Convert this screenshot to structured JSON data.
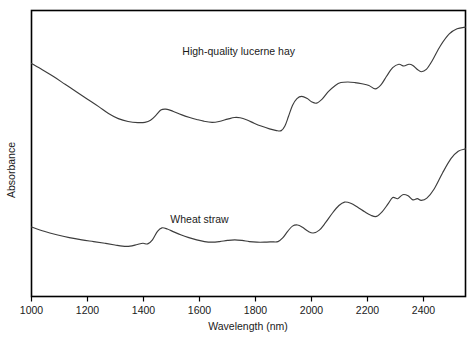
{
  "chart_data": {
    "type": "line",
    "title": "",
    "xlabel": "Wavelength (nm)",
    "ylabel": "Absorbance",
    "xlim": [
      1000,
      2550
    ],
    "ylim": [
      0,
      1
    ],
    "grid": false,
    "legend_position": "inline-annotations",
    "xticks": [
      1000,
      1200,
      1400,
      1600,
      1800,
      2000,
      2200,
      2400
    ],
    "xtick_labels": [
      "1000",
      "1200",
      "1400",
      "1600",
      "1800",
      "2000",
      "2200",
      "2400"
    ],
    "yticks": [],
    "ytick_labels": [],
    "annotations": [
      {
        "text": "High-quality lucerne hay",
        "x": 1740,
        "y": 0.845
      },
      {
        "text": "Wheat straw",
        "x": 1600,
        "y": 0.258
      }
    ],
    "series": [
      {
        "name": "High-quality lucerne hay",
        "color": "#3d3d3d",
        "x": [
          1000,
          1040,
          1080,
          1120,
          1160,
          1200,
          1240,
          1275,
          1310,
          1345,
          1380,
          1405,
          1425,
          1445,
          1462,
          1480,
          1505,
          1535,
          1565,
          1590,
          1615,
          1645,
          1670,
          1700,
          1725,
          1745,
          1770,
          1795,
          1820,
          1850,
          1875,
          1892,
          1905,
          1918,
          1932,
          1948,
          1965,
          1985,
          2000,
          2018,
          2038,
          2060,
          2085,
          2105,
          2130,
          2155,
          2180,
          2205,
          2228,
          2248,
          2268,
          2290,
          2312,
          2330,
          2348,
          2362,
          2378,
          2392,
          2410,
          2432,
          2460,
          2492,
          2520,
          2550
        ],
        "y": [
          0.815,
          0.792,
          0.768,
          0.742,
          0.716,
          0.69,
          0.664,
          0.64,
          0.622,
          0.612,
          0.608,
          0.609,
          0.616,
          0.634,
          0.652,
          0.655,
          0.648,
          0.636,
          0.626,
          0.619,
          0.613,
          0.609,
          0.612,
          0.62,
          0.626,
          0.625,
          0.617,
          0.606,
          0.596,
          0.586,
          0.58,
          0.58,
          0.596,
          0.63,
          0.668,
          0.692,
          0.7,
          0.692,
          0.681,
          0.676,
          0.69,
          0.716,
          0.738,
          0.748,
          0.75,
          0.748,
          0.744,
          0.738,
          0.726,
          0.74,
          0.77,
          0.8,
          0.812,
          0.806,
          0.812,
          0.808,
          0.794,
          0.786,
          0.794,
          0.826,
          0.876,
          0.918,
          0.936,
          0.942
        ]
      },
      {
        "name": "Wheat straw",
        "color": "#3d3d3d",
        "x": [
          1000,
          1045,
          1090,
          1135,
          1180,
          1222,
          1262,
          1298,
          1325,
          1352,
          1378,
          1398,
          1415,
          1432,
          1450,
          1466,
          1485,
          1508,
          1535,
          1562,
          1590,
          1618,
          1645,
          1672,
          1700,
          1726,
          1752,
          1778,
          1805,
          1832,
          1858,
          1880,
          1898,
          1915,
          1932,
          1950,
          1968,
          1988,
          2006,
          2028,
          2050,
          2075,
          2098,
          2118,
          2140,
          2165,
          2190,
          2212,
          2232,
          2252,
          2272,
          2290,
          2308,
          2326,
          2345,
          2362,
          2378,
          2392,
          2412,
          2438,
          2468,
          2498,
          2524,
          2550
        ],
        "y": [
          0.243,
          0.228,
          0.216,
          0.206,
          0.198,
          0.192,
          0.186,
          0.18,
          0.176,
          0.176,
          0.182,
          0.186,
          0.184,
          0.198,
          0.228,
          0.24,
          0.236,
          0.226,
          0.215,
          0.206,
          0.198,
          0.192,
          0.19,
          0.192,
          0.196,
          0.198,
          0.196,
          0.192,
          0.19,
          0.19,
          0.191,
          0.192,
          0.206,
          0.228,
          0.246,
          0.25,
          0.242,
          0.228,
          0.222,
          0.232,
          0.258,
          0.292,
          0.318,
          0.33,
          0.326,
          0.312,
          0.296,
          0.284,
          0.28,
          0.296,
          0.322,
          0.346,
          0.342,
          0.356,
          0.352,
          0.338,
          0.342,
          0.336,
          0.344,
          0.376,
          0.432,
          0.482,
          0.508,
          0.516
        ]
      }
    ]
  }
}
